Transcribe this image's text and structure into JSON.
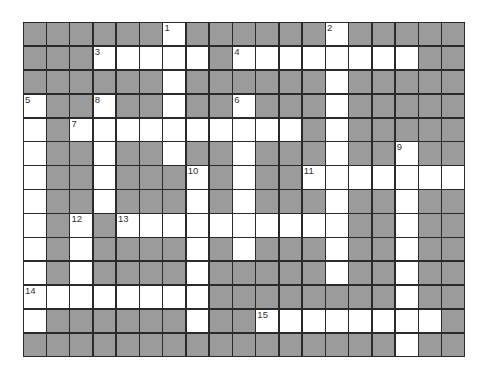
{
  "puzzle": {
    "type": "crossword",
    "cols": 19,
    "rows": 14,
    "colors": {
      "block": "#9b9b9b",
      "open": "#ffffff",
      "line": "#2a2a2a"
    },
    "layout": [
      "######1######2#####",
      "###3WWWW#4WWWWWWW##",
      "######W######W#####",
      "5##8##W##6###W#####",
      "W#7WWWWWWWWW#W#####",
      "W##W##W##W###W##9##",
      "W##W###A#W##BWWWWWW",
      "W##W###W#W###W##W##",
      "W#C#DWWWWWWWWW##W##",
      "W#W####W#W###W##W##",
      "W#W####W#####W##W##",
      "EWWWWWWW########W##",
      "W######W##FWWWWWWW#",
      "################W##"
    ],
    "numbers": [
      {
        "label": "1",
        "row": 0,
        "col": 6
      },
      {
        "label": "2",
        "row": 0,
        "col": 13
      },
      {
        "label": "3",
        "row": 1,
        "col": 3
      },
      {
        "label": "4",
        "row": 1,
        "col": 9
      },
      {
        "label": "5",
        "row": 3,
        "col": 0
      },
      {
        "label": "8",
        "row": 3,
        "col": 3
      },
      {
        "label": "6",
        "row": 3,
        "col": 9
      },
      {
        "label": "7",
        "row": 4,
        "col": 2
      },
      {
        "label": "9",
        "row": 5,
        "col": 16
      },
      {
        "label": "10",
        "row": 6,
        "col": 7
      },
      {
        "label": "11",
        "row": 6,
        "col": 12
      },
      {
        "label": "12",
        "row": 8,
        "col": 2
      },
      {
        "label": "13",
        "row": 8,
        "col": 4
      },
      {
        "label": "14",
        "row": 11,
        "col": 0
      },
      {
        "label": "15",
        "row": 12,
        "col": 10
      }
    ],
    "open_cells": [
      [
        6,
        13
      ],
      [
        3,
        4,
        5,
        6,
        7,
        9,
        10,
        11,
        12,
        13,
        14,
        15,
        16
      ],
      [
        6,
        13
      ],
      [
        0,
        3,
        6,
        9,
        13
      ],
      [
        0,
        2,
        3,
        4,
        5,
        6,
        7,
        8,
        9,
        10,
        11,
        13
      ],
      [
        0,
        3,
        6,
        9,
        13,
        16
      ],
      [
        0,
        3,
        7,
        9,
        12,
        13,
        14,
        15,
        16,
        17,
        18
      ],
      [
        0,
        3,
        7,
        9,
        13,
        16
      ],
      [
        0,
        2,
        4,
        5,
        6,
        7,
        8,
        9,
        10,
        11,
        12,
        13,
        16
      ],
      [
        0,
        2,
        7,
        9,
        13,
        16
      ],
      [
        0,
        2,
        7,
        13,
        16
      ],
      [
        0,
        1,
        2,
        3,
        4,
        5,
        6,
        7,
        16
      ],
      [
        0,
        7,
        10,
        11,
        12,
        13,
        14,
        15,
        16,
        17
      ],
      [
        16
      ]
    ]
  }
}
